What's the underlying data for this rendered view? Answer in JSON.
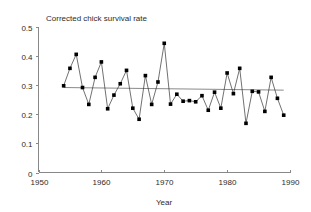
{
  "chart_data": {
    "type": "line",
    "title": "Corrected chick survival rate",
    "xlabel": "Year",
    "ylabel": "",
    "xlim": [
      1950,
      1990
    ],
    "ylim": [
      0,
      0.5
    ],
    "grid": false,
    "legend": "none",
    "marker": "filled-square",
    "xticks": [
      1950,
      1960,
      1970,
      1980,
      1990
    ],
    "xticklabels": [
      "1950",
      "1960",
      "1970",
      "1980",
      "1990"
    ],
    "yticks": [
      0,
      0.1,
      0.2,
      0.3,
      0.4,
      0.5
    ],
    "yticklabels": [
      "0",
      "0.1",
      "0.2",
      "0.3",
      "0.4",
      "0.5"
    ],
    "x": [
      1954,
      1955,
      1956,
      1957,
      1958,
      1959,
      1960,
      1961,
      1962,
      1963,
      1964,
      1965,
      1966,
      1967,
      1968,
      1969,
      1970,
      1971,
      1972,
      1973,
      1974,
      1975,
      1976,
      1977,
      1978,
      1979,
      1980,
      1981,
      1982,
      1983,
      1984,
      1985,
      1986,
      1987,
      1988,
      1989
    ],
    "values": [
      0.298,
      0.358,
      0.406,
      0.292,
      0.234,
      0.327,
      0.38,
      0.219,
      0.266,
      0.305,
      0.351,
      0.221,
      0.183,
      0.333,
      0.234,
      0.311,
      0.444,
      0.235,
      0.269,
      0.245,
      0.247,
      0.243,
      0.264,
      0.214,
      0.276,
      0.221,
      0.342,
      0.271,
      0.358,
      0.169,
      0.279,
      0.277,
      0.21,
      0.327,
      0.255,
      0.197
    ],
    "series": [
      {
        "name": "Corrected chick survival rate",
        "values": [
          0.298,
          0.358,
          0.406,
          0.292,
          0.234,
          0.327,
          0.38,
          0.219,
          0.266,
          0.305,
          0.351,
          0.221,
          0.183,
          0.333,
          0.234,
          0.311,
          0.444,
          0.235,
          0.269,
          0.245,
          0.247,
          0.243,
          0.264,
          0.214,
          0.276,
          0.221,
          0.342,
          0.271,
          0.358,
          0.169,
          0.279,
          0.277,
          0.21,
          0.327,
          0.255,
          0.197
        ]
      }
    ],
    "trend_line": {
      "name": "regression line",
      "x": [
        1954,
        1989
      ],
      "y": [
        0.292,
        0.283
      ]
    },
    "colors": {
      "marker": "#000000",
      "line": "#333333",
      "trend": "#8a8a8a",
      "axis": "#888888",
      "text": "#2b2b2b",
      "background": "#ffffff"
    }
  }
}
